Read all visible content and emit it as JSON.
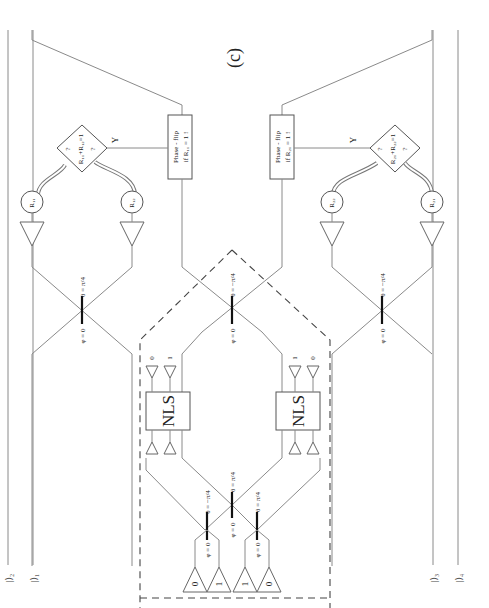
{
  "figure": {
    "panel_label": "(c)",
    "orientation": "rotated-90-ccw"
  },
  "inputs": [
    {
      "id": "ket-1",
      "label": "|⟩₁"
    },
    {
      "id": "ket-2",
      "label": "|⟩₂"
    },
    {
      "id": "ket-3",
      "label": "|⟩₃"
    },
    {
      "id": "ket-4",
      "label": "|⟩₄"
    }
  ],
  "beam_splitters": {
    "phi_label": "φ = 0",
    "theta_pos": "θ = π/4",
    "theta_neg": "θ = −π/4"
  },
  "nls": [
    {
      "label": "NLS",
      "ancilla_in": [
        "1",
        "0"
      ],
      "ancilla_out": [
        "1",
        "0"
      ]
    },
    {
      "label": "NLS",
      "ancilla_in": [
        "0",
        "1"
      ],
      "ancilla_out": [
        "0",
        "1"
      ]
    }
  ],
  "sources": [
    "0",
    "1",
    "1",
    "0"
  ],
  "detectors": [
    {
      "id": "R11",
      "label": "R₁₁"
    },
    {
      "id": "R12",
      "label": "R₁₂"
    },
    {
      "id": "R21",
      "label": "R₂₁"
    },
    {
      "id": "R22",
      "label": "R₂₂"
    }
  ],
  "decisions": [
    {
      "line1": "?",
      "line2": "R₁₁+R₁₂=1",
      "line3": "?",
      "yes": "Y"
    },
    {
      "line1": "?",
      "line2": "R₂₁+R₂₂=1",
      "line3": "?",
      "yes": "Y"
    }
  ],
  "phase_flips": [
    {
      "line1": "Phase - flip",
      "line2": "if R₁₁ = 1 !"
    },
    {
      "line1": "Phase - flip",
      "line2": "if R₂₁ = 1 !"
    }
  ]
}
